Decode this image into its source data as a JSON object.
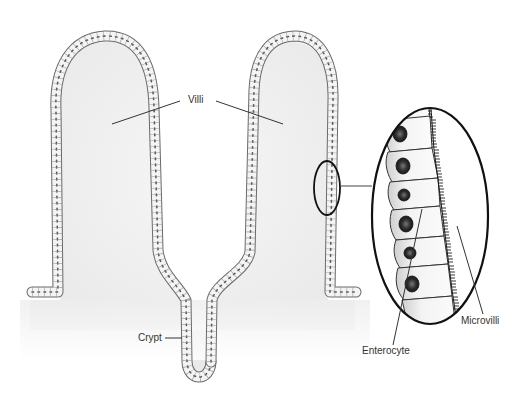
{
  "diagram": {
    "labels": {
      "villi": "Villi",
      "crypt": "Crypt",
      "enterocyte": "Enterocyte",
      "microvilli": "Microvilli"
    },
    "colors": {
      "background": "#ffffff",
      "tissue_fill": "#f0f0f0",
      "cell_fill": "#f7f7f7",
      "cell_outline": "#6a6a6a",
      "nucleus": "#3a3a3a",
      "leader_line": "#333333",
      "callout_ellipse": "#111111"
    }
  }
}
